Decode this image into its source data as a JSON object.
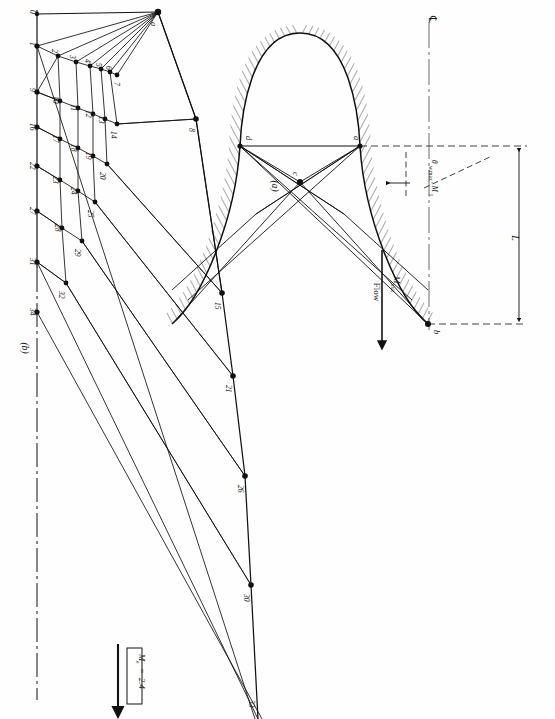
{
  "figure": {
    "kind": "method-of-characteristics-nozzle-design",
    "orientation_note": "page rotated 90 degrees counter-clockwise",
    "panels": [
      {
        "id": "a",
        "tag": "(a)",
        "title_hidden": true
      },
      {
        "id": "b",
        "tag": "(b)",
        "title_hidden": true
      }
    ]
  },
  "panel_a": {
    "tag": "(a)",
    "centerline_symbol": "℄",
    "flow_label": "Flow",
    "mach_exit_label": "M",
    "mach_exit_sub": "exit",
    "angle_label": "θ",
    "angle_sub": "w,max",
    "angle_label_2": ", M",
    "angle_sub_2": "L",
    "length_label": "L",
    "points": [
      {
        "name": "a",
        "role": "throat-wall-upper-right"
      },
      {
        "name": "d",
        "role": "throat-wall-upper-left"
      },
      {
        "name": "c",
        "role": "centerline-node"
      },
      {
        "name": "b",
        "role": "nozzle-exit-lip"
      }
    ],
    "wall_hatching": "hatched nozzle wall"
  },
  "panel_b": {
    "tag": "(b)",
    "apex_point": "a",
    "exit_mach_box": {
      "symbol": "M",
      "sub": "e",
      "equals": "=",
      "value": "2.4"
    },
    "centerline_style": "dash-dot",
    "characteristic_nodes": [
      {
        "id": "0",
        "label": "0",
        "type": "wall-start"
      },
      {
        "id": "1",
        "label": "1",
        "type": "centerline"
      },
      {
        "id": "2",
        "label": "2",
        "type": "interior"
      },
      {
        "id": "3",
        "label": "3",
        "type": "interior"
      },
      {
        "id": "4",
        "label": "4",
        "type": "interior"
      },
      {
        "id": "5",
        "label": "5",
        "type": "interior"
      },
      {
        "id": "6",
        "label": "6",
        "type": "interior"
      },
      {
        "id": "7",
        "label": "7",
        "type": "interior"
      },
      {
        "id": "8",
        "label": "8",
        "type": "wall"
      },
      {
        "id": "9",
        "label": "9",
        "type": "centerline"
      },
      {
        "id": "10",
        "label": "10",
        "type": "interior"
      },
      {
        "id": "11",
        "label": "11",
        "type": "interior"
      },
      {
        "id": "12",
        "label": "12",
        "type": "interior"
      },
      {
        "id": "13",
        "label": "13",
        "type": "interior"
      },
      {
        "id": "14",
        "label": "14",
        "type": "interior"
      },
      {
        "id": "15",
        "label": "15",
        "type": "wall"
      },
      {
        "id": "16",
        "label": "16",
        "type": "centerline"
      },
      {
        "id": "17",
        "label": "17",
        "type": "interior"
      },
      {
        "id": "18",
        "label": "18",
        "type": "interior"
      },
      {
        "id": "19",
        "label": "19",
        "type": "interior"
      },
      {
        "id": "20",
        "label": "20",
        "type": "interior"
      },
      {
        "id": "21",
        "label": "21",
        "type": "wall"
      },
      {
        "id": "22",
        "label": "22",
        "type": "centerline"
      },
      {
        "id": "23",
        "label": "23",
        "type": "interior"
      },
      {
        "id": "24",
        "label": "24",
        "type": "interior"
      },
      {
        "id": "25",
        "label": "25",
        "type": "interior"
      },
      {
        "id": "26",
        "label": "26",
        "type": "wall"
      },
      {
        "id": "27",
        "label": "27",
        "type": "centerline"
      },
      {
        "id": "28",
        "label": "28",
        "type": "interior"
      },
      {
        "id": "29",
        "label": "29",
        "type": "interior"
      },
      {
        "id": "30",
        "label": "30",
        "type": "wall"
      },
      {
        "id": "31",
        "label": "31",
        "type": "centerline"
      },
      {
        "id": "32",
        "label": "32",
        "type": "interior"
      },
      {
        "id": "33",
        "label": "33",
        "type": "wall"
      },
      {
        "id": "34",
        "label": "34",
        "type": "centerline"
      }
    ]
  }
}
